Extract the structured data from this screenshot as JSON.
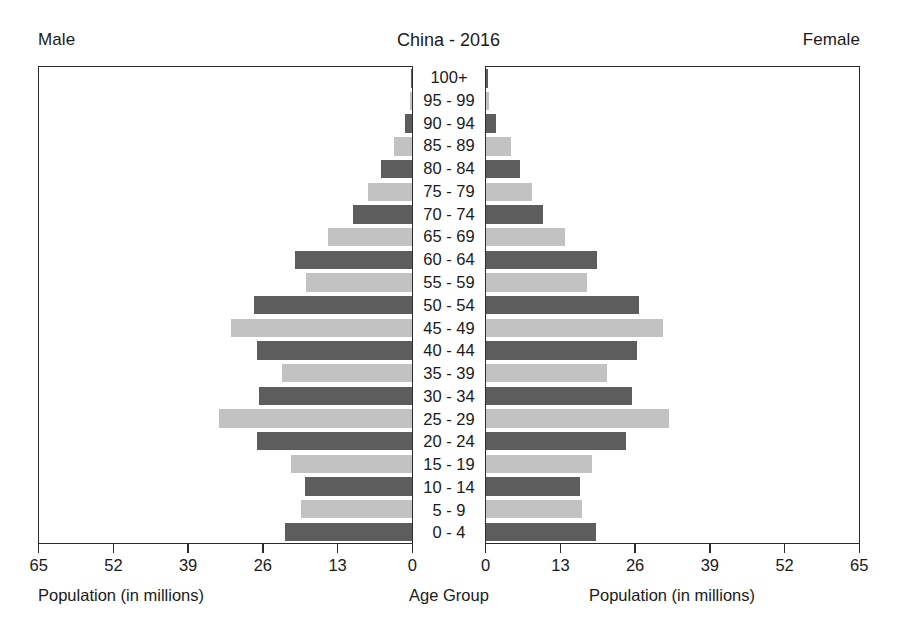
{
  "header": {
    "left_label": "Male",
    "title": "China - 2016",
    "right_label": "Female"
  },
  "footer": {
    "left_caption": "Population (in millions)",
    "center_caption": "Age Group",
    "right_caption": "Population (in millions)"
  },
  "colors": {
    "bar_dark": "#5d5d5d",
    "bar_light": "#c2c2c2",
    "axis": "#2b2b2b",
    "text": "#1a1a1a",
    "background": "#ffffff"
  },
  "chart_data": {
    "type": "bar",
    "subtype": "population-pyramid",
    "title": "China - 2016",
    "xlabel": "Population (in millions)",
    "ylabel": "Age Group",
    "grid": false,
    "legend": "none",
    "xlim": [
      0,
      65
    ],
    "xticks": [
      0,
      13,
      26,
      39,
      52,
      65
    ],
    "left_axis_tick_labels": [
      "65",
      "52",
      "39",
      "26",
      "13",
      "0"
    ],
    "right_axis_tick_labels": [
      "0",
      "13",
      "26",
      "39",
      "52",
      "65"
    ],
    "categories": [
      "100+",
      "95 - 99",
      "90 - 94",
      "85 - 89",
      "80 - 84",
      "75 - 79",
      "70 - 74",
      "65 - 69",
      "60 - 64",
      "55 - 59",
      "50 - 54",
      "45 - 49",
      "40 - 44",
      "35 - 39",
      "30 - 34",
      "25 - 29",
      "20 - 24",
      "15 - 19",
      "10 - 14",
      "5 - 9",
      "0 - 4"
    ],
    "series": [
      {
        "name": "Male",
        "side": "left",
        "values": [
          0.1,
          0.4,
          1.3,
          3.2,
          5.4,
          7.7,
          10.3,
          14.6,
          20.4,
          18.5,
          27.6,
          31.6,
          27.0,
          22.6,
          26.6,
          33.6,
          27.1,
          21.1,
          18.7,
          19.3,
          22.1
        ]
      },
      {
        "name": "Female",
        "side": "right",
        "values": [
          0.3,
          0.6,
          1.8,
          4.3,
          5.9,
          8.0,
          10.0,
          13.7,
          19.4,
          17.6,
          26.6,
          30.9,
          26.3,
          21.1,
          25.4,
          31.9,
          24.4,
          18.5,
          16.3,
          16.8,
          19.1
        ]
      }
    ],
    "bar_shading": {
      "pattern": "alternating",
      "even_index_color": "#5d5d5d",
      "odd_index_color": "#c2c2c2"
    }
  }
}
